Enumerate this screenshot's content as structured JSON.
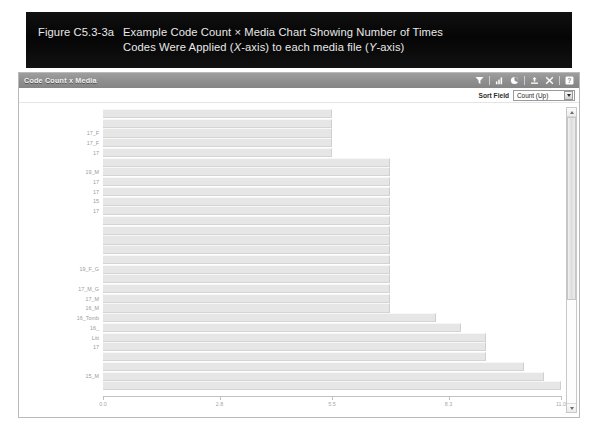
{
  "caption": {
    "label": "Figure C5.3-3a",
    "line1": "Example Code Count × Media Chart Showing Number of Times",
    "line2_a": "Codes Were Applied (",
    "line2_x": "X",
    "line2_b": "-axis) to each media file (",
    "line2_y": "Y",
    "line2_c": "-axis)"
  },
  "window": {
    "panel_title": "Code Count x Media",
    "toolbar": [
      {
        "name": "filter-icon",
        "label": "Filter"
      },
      {
        "name": "bar-chart-icon",
        "label": "Bar Chart"
      },
      {
        "name": "pie-chart-icon",
        "label": "Pie Chart"
      },
      {
        "name": "export-icon",
        "label": "Export"
      },
      {
        "name": "resize-icon",
        "label": "Resize"
      },
      {
        "name": "help-icon",
        "label": "Help"
      }
    ],
    "sort": {
      "label": "Sort Field",
      "value": "Count (Up)",
      "options": [
        "Count (Up)",
        "Count (Down)",
        "Name (Up)",
        "Name (Down)"
      ]
    }
  },
  "chart_data": {
    "type": "bar",
    "orientation": "horizontal",
    "title": "Code Count x Media",
    "xlabel": "",
    "ylabel": "",
    "xlim": [
      0.0,
      11.0
    ],
    "grid": false,
    "legend": null,
    "xticks": [
      0.0,
      2.8,
      5.5,
      8.3,
      11.0
    ],
    "xticklabels": [
      "0.0",
      "2.8",
      "5.5",
      "8.3",
      "11.0"
    ],
    "bar_color": "#e6e6e6",
    "categories": [
      "",
      "",
      "17_F",
      "17_F",
      "17",
      "",
      "19_M",
      "17",
      "17",
      "15",
      "17",
      "",
      "",
      "",
      "",
      "",
      "19_F_G",
      "",
      "17_M_G",
      "17_M",
      "16_M",
      "16_Tomb",
      "16_",
      "Litt",
      "17",
      "",
      "",
      "15_M",
      ""
    ],
    "values": [
      5.5,
      5.5,
      5.5,
      5.5,
      5.5,
      6.9,
      6.9,
      6.9,
      6.9,
      6.9,
      6.9,
      6.9,
      6.9,
      6.9,
      6.9,
      6.9,
      6.9,
      6.9,
      6.9,
      6.9,
      6.9,
      8.0,
      8.6,
      9.2,
      9.2,
      9.2,
      10.1,
      10.6,
      11.0
    ]
  }
}
